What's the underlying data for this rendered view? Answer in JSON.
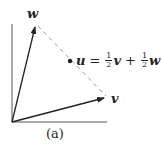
{
  "diagram": {
    "caption": "(a)",
    "vectors": [
      {
        "name": "w",
        "label": "w",
        "from": [
          12,
          122
        ],
        "to": [
          36,
          26
        ]
      },
      {
        "name": "v",
        "label": "v",
        "from": [
          12,
          122
        ],
        "to": [
          105,
          98
        ]
      }
    ],
    "dashed_line": {
      "from": [
        38,
        26
      ],
      "to": [
        106,
        96
      ]
    },
    "midpoint": {
      "position": [
        70,
        61
      ],
      "label_lhs": "u",
      "equals": "=",
      "frac1_num": "1",
      "frac1_den": "2",
      "term1": "v",
      "plus": "+",
      "frac2_num": "1",
      "frac2_den": "2",
      "term2": "w"
    },
    "colors": {
      "ink": "#222222",
      "axis": "#555555",
      "dash": "#9a9a9a"
    }
  }
}
